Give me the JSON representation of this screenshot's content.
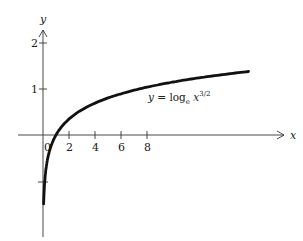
{
  "chart_data": {
    "type": "line",
    "title": "",
    "xlabel": "x",
    "ylabel": "y",
    "x_ticks": [
      2,
      4,
      6,
      8
    ],
    "y_ticks": [
      1,
      2,
      -1
    ],
    "y_tick_labels": [
      "1",
      "2"
    ],
    "origin_label": "0",
    "xlim": [
      -2,
      17
    ],
    "ylim": [
      -2.3,
      2.4
    ],
    "grid": false,
    "legend": null,
    "annotation": {
      "text": "y = log_e x^{3/2}",
      "prefix": "y = log",
      "sub": "e",
      "base": " x",
      "sup": "3/2"
    },
    "series": [
      {
        "name": "y = log_e x^{3/2}",
        "x": [
          0.05,
          0.1,
          0.2,
          0.5,
          1,
          2,
          4,
          6,
          8,
          10,
          12,
          14,
          16
        ],
        "values": [
          -1.5,
          -1.15,
          -0.8,
          -0.35,
          0,
          0.35,
          0.69,
          0.9,
          1.04,
          1.15,
          1.24,
          1.32,
          1.39
        ]
      }
    ]
  },
  "axes": {
    "x_label": "x",
    "y_label": "y",
    "x_tick_labels": [
      "2",
      "4",
      "6",
      "8"
    ],
    "y_tick_labels": [
      "2",
      "1"
    ],
    "origin": "0"
  },
  "equation": {
    "prefix": "y = log",
    "sub": "e",
    "base": " x",
    "sup": "3/2"
  }
}
